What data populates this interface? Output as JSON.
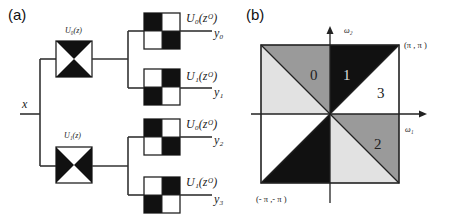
{
  "figure": {
    "panel_a": {
      "label": "(a)",
      "input_label": "x",
      "stage1_filters": [
        {
          "name": "U0",
          "label": "U₀(z)",
          "pattern": "hourglass"
        },
        {
          "name": "U1",
          "label": "U₁(z)",
          "pattern": "bowtie"
        }
      ],
      "stage2_filters": [
        {
          "label": "U₀(zᴼ)",
          "output": "y₀",
          "pattern": "checker-tl"
        },
        {
          "label": "U₁(zᴼ)",
          "output": "y₁",
          "pattern": "checker-tr"
        },
        {
          "label": "U₀(zᴼ)",
          "output": "y₂",
          "pattern": "checker-tl"
        },
        {
          "label": "U₁(zᴼ)",
          "output": "y₃",
          "pattern": "checker-tr"
        }
      ]
    },
    "panel_b": {
      "label": "(b)",
      "x_axis_label": "ω₁",
      "y_axis_label": "ω₂",
      "corner_top_right": "(π , π )",
      "corner_bottom_left": "(- π ,- π )",
      "regions": [
        "0",
        "1",
        "2",
        "3"
      ],
      "colors": {
        "dark": "#111111",
        "mid_gray": "#9a9a9a",
        "light_gray": "#e2e2e2",
        "white": "#ffffff"
      }
    }
  }
}
